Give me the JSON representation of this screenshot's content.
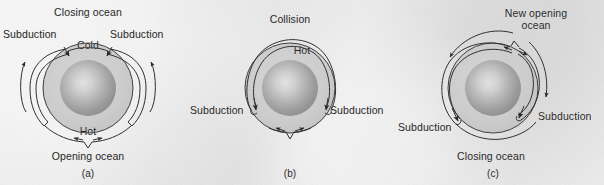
{
  "figure": {
    "background_color": "#e9e9e9",
    "line_color": "#2a2a2a",
    "mantle_color": "#c9c9c9",
    "core_color": "#9a9a9a"
  },
  "panels": [
    {
      "caption": "(a)",
      "cx": 88,
      "cy": 88,
      "labels": {
        "top": "Closing ocean",
        "left": "Subduction",
        "right": "Subduction",
        "inner_top": "Cold",
        "inner_bottom": "Hot",
        "bottom": "Opening ocean"
      }
    },
    {
      "caption": "(b)",
      "cx": 290,
      "cy": 88,
      "labels": {
        "top": "Collision",
        "inner_top": "Hot",
        "left": "Subduction",
        "right": "Subduction"
      }
    },
    {
      "caption": "(c)",
      "cx": 493,
      "cy": 88,
      "labels": {
        "top_line1": "New opening",
        "top_line2": "ocean",
        "left": "Subduction",
        "right": "Subduction",
        "bottom": "Closing ocean"
      }
    }
  ]
}
